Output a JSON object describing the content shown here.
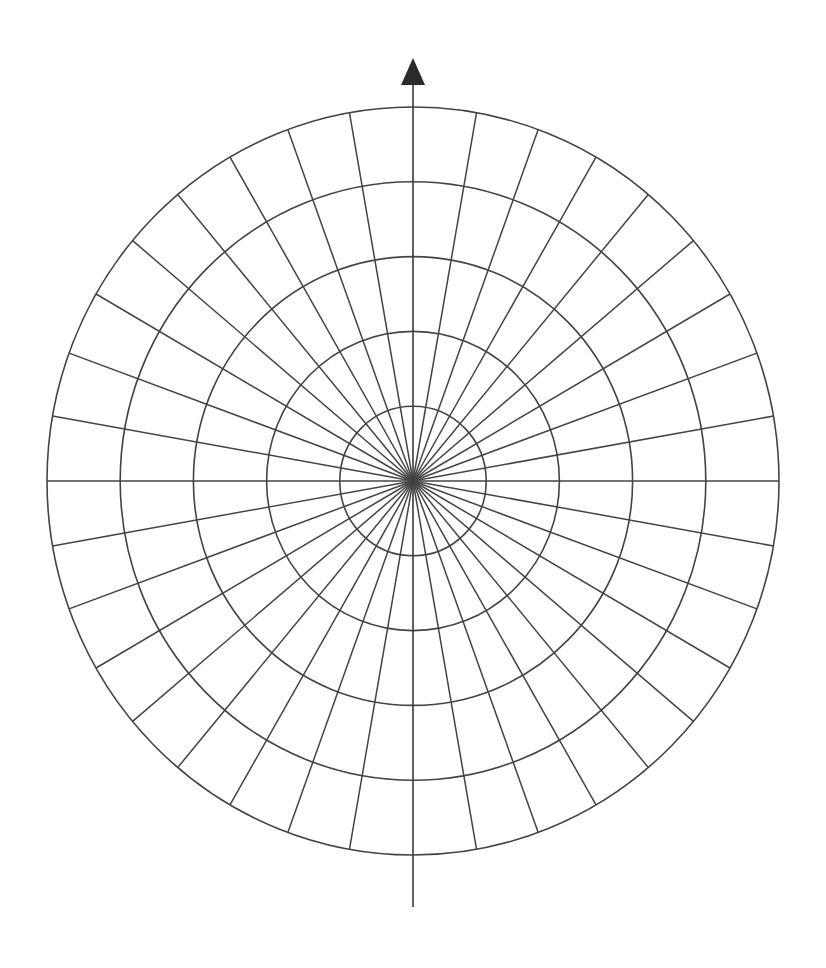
{
  "diagram": {
    "type": "polar-grid",
    "title": "",
    "canvas": {
      "width": 826,
      "height": 968,
      "background": "#ffffff"
    },
    "center": {
      "x": 413,
      "y": 481
    },
    "scale": {
      "rx_per_unit": 73.2,
      "ry_per_unit": 74.8
    },
    "rings": [
      1,
      2,
      3,
      4,
      5
    ],
    "spoke_count": 36,
    "spoke_step_deg": 10,
    "line_color": "#444444",
    "vertical_axis": {
      "top_y": 85,
      "bottom_y": 907,
      "arrow": {
        "direction": "up",
        "tip_y": 58,
        "base_y": 85,
        "half_width": 12,
        "color": "#2b2b2b"
      }
    }
  }
}
